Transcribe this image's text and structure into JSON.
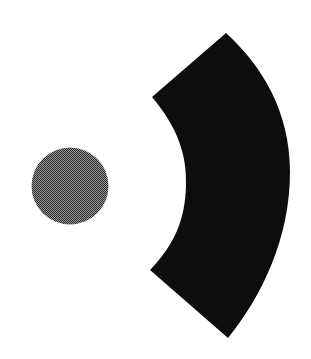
{
  "canvas": {
    "width": 311,
    "height": 359,
    "background_color": "#ffffff",
    "title": "Two geometric shapes on white background"
  },
  "shapes": [
    {
      "id": "gray-circle",
      "name": "circle",
      "label": "Dithered gray circle",
      "fill_style": "halftone-dither",
      "fill_color": "#4a4a4a",
      "dither_dot_color": "#2b2b2b",
      "dither_base_color": "#9a9a9a",
      "stroke": "none",
      "center_x": 70,
      "center_y": 186,
      "radius": 38.5,
      "diameter": 77,
      "bounds": {
        "left": 31,
        "top": 148,
        "right": 108,
        "bottom": 225
      }
    },
    {
      "id": "black-arc-wedge",
      "name": "annular-sector",
      "label": "Black curved arc wedge",
      "fill_style": "solid",
      "fill_color": "#0d0d0d",
      "stroke": "none",
      "apex_x": 226,
      "apex_y": 33,
      "left_corner_x": 152,
      "left_corner_y": 97,
      "inner_arc_extreme_x": 186,
      "inner_arc_extreme_y": 185,
      "bottom_left_corner_x": 150,
      "bottom_left_corner_y": 270,
      "bottom_tip_x": 228,
      "bottom_tip_y": 338,
      "outer_arc_extreme_x": 290,
      "outer_arc_extreme_y": 172,
      "bounds": {
        "left": 150,
        "top": 33,
        "right": 290,
        "bottom": 340
      },
      "path": "M 226 33 L 152 97 C 178 128 187 155 186 186 C 185 218 176 243 150 270 L 228 338 C 262 296 290 238 290 172 C 290 111 262 66 226 33 Z"
    }
  ]
}
